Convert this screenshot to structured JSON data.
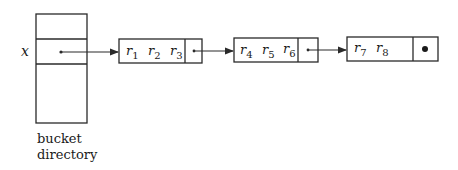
{
  "directory": {
    "pointer_label": "x",
    "caption_line1": "bucket",
    "caption_line2": "directory"
  },
  "buckets": [
    {
      "records": [
        {
          "base": "r",
          "sub": "1"
        },
        {
          "base": "r",
          "sub": "2"
        },
        {
          "base": "r",
          "sub": "3"
        }
      ],
      "next": "pointer"
    },
    {
      "records": [
        {
          "base": "r",
          "sub": "4"
        },
        {
          "base": "r",
          "sub": "5"
        },
        {
          "base": "r",
          "sub": "6"
        }
      ],
      "next": "pointer"
    },
    {
      "records": [
        {
          "base": "r",
          "sub": "7"
        },
        {
          "base": "r",
          "sub": "8"
        }
      ],
      "next": "null"
    }
  ],
  "colors": {
    "line": "#2a2a2a",
    "background": "#ffffff"
  }
}
